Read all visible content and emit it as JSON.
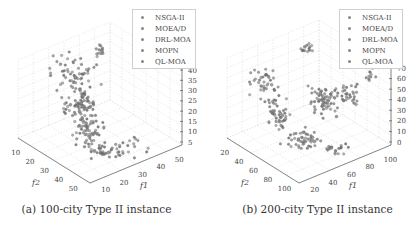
{
  "chart_data": [
    {
      "type": "scatter",
      "subtype": "3d-scatter",
      "title": "",
      "caption": "(a) 100-city Type II instance",
      "xlabel": "f1",
      "ylabel": "f2",
      "zlabel": "",
      "x_ticks": [
        "10",
        "20",
        "30",
        "40",
        "50"
      ],
      "y_ticks": [
        "10",
        "20",
        "30",
        "40",
        "50"
      ],
      "z_ticks": [
        "5",
        "10",
        "15",
        "20",
        "25",
        "30",
        "35",
        "40"
      ],
      "xlim": [
        5,
        55
      ],
      "ylim": [
        5,
        55
      ],
      "zlim": [
        0,
        42
      ],
      "grid": true,
      "legend_position": "upper right",
      "legend": [
        "NSGA-II",
        "MOEA/D",
        "DRL-MOA",
        "MOPN",
        "QL-MOA"
      ],
      "series_colors": [
        "#8c8c8c",
        "#7a7a7a",
        "#9a9a9a",
        "#6e6e6e",
        "#a5a5a5"
      ]
    },
    {
      "type": "scatter",
      "subtype": "3d-scatter",
      "title": "",
      "caption": "(b) 200-city Type II instance",
      "xlabel": "f1",
      "ylabel": "f2",
      "zlabel": "",
      "x_ticks": [
        "20",
        "40",
        "60",
        "80",
        "100"
      ],
      "y_ticks": [
        "20",
        "40",
        "60",
        "80",
        "100"
      ],
      "z_ticks": [
        "0",
        "10",
        "20",
        "30",
        "40",
        "50",
        "60",
        "70"
      ],
      "xlim": [
        10,
        110
      ],
      "ylim": [
        10,
        110
      ],
      "zlim": [
        0,
        75
      ],
      "grid": true,
      "legend_position": "upper right",
      "legend": [
        "NSGA-II",
        "MOEA/D",
        "DRL-MOA",
        "MOPN",
        "QL-MOA"
      ],
      "series_colors": [
        "#8c8c8c",
        "#7a7a7a",
        "#9a9a9a",
        "#6e6e6e",
        "#a5a5a5"
      ]
    }
  ],
  "panels": [
    {
      "caption": "(a) 100-city Type II instance",
      "legend": [
        {
          "label": "NSGA-II",
          "color": "#8c8c8c"
        },
        {
          "label": "MOEA/D",
          "color": "#7a7a7a"
        },
        {
          "label": "DRL-MOA",
          "color": "#9a9a9a"
        },
        {
          "label": "MOPN",
          "color": "#6e6e6e"
        },
        {
          "label": "QL-MOA",
          "color": "#a5a5a5"
        }
      ],
      "z_ticks": [
        "40",
        "35",
        "30",
        "25",
        "20",
        "15",
        "10",
        "5"
      ],
      "f2_ticks": [
        "10",
        "20",
        "30",
        "40",
        "50"
      ],
      "f1_ticks": [
        "10",
        "20",
        "30",
        "40",
        "50"
      ],
      "f2_label": "f2",
      "f1_label": "f1"
    },
    {
      "caption": "(b) 200-city Type II instance",
      "legend": [
        {
          "label": "NSGA-II",
          "color": "#8c8c8c"
        },
        {
          "label": "MOEA/D",
          "color": "#7a7a7a"
        },
        {
          "label": "DRL-MOA",
          "color": "#9a9a9a"
        },
        {
          "label": "MOPN",
          "color": "#6e6e6e"
        },
        {
          "label": "QL-MOA",
          "color": "#a5a5a5"
        }
      ],
      "z_ticks": [
        "70",
        "60",
        "50",
        "40",
        "30",
        "20",
        "10",
        "0"
      ],
      "f2_ticks": [
        "20",
        "40",
        "60",
        "80",
        "100"
      ],
      "f1_ticks": [
        "20",
        "40",
        "60",
        "80",
        "100"
      ],
      "f2_label": "f2",
      "f1_label": "f1"
    }
  ]
}
